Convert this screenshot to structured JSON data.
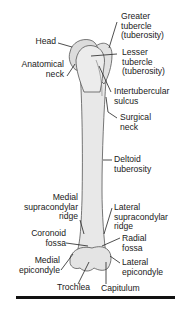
{
  "figure": {
    "bone_color": "#e6e6e6",
    "outline_color": "#555555",
    "leader_color": "#222222",
    "labels": {
      "greater_tubercle": [
        "Greater",
        "tubercle",
        "(tuberosity)"
      ],
      "head": [
        "Head"
      ],
      "lesser_tubercle": [
        "Lesser",
        "tubercle",
        "(tuberosity)"
      ],
      "anatomical_neck": [
        "Anatomical",
        "neck"
      ],
      "intertubercular_sulcus": [
        "Intertubercular",
        "sulcus"
      ],
      "surgical_neck": [
        "Surgical",
        "neck"
      ],
      "deltoid_tuberosity": [
        "Deltoid",
        "tuberosity"
      ],
      "medial_supracondylar_ridge": [
        "Medial",
        "supracondylar",
        "ridge"
      ],
      "lateral_supracondylar_ridge": [
        "Lateral",
        "supracondylar",
        "ridge"
      ],
      "coronoid_fossa": [
        "Coronoid",
        "fossa"
      ],
      "radial_fossa": [
        "Radial",
        "fossa"
      ],
      "medial_epicondyle": [
        "Medial",
        "epicondyle"
      ],
      "lateral_epicondyle": [
        "Lateral",
        "epicondyle"
      ],
      "trochlea": [
        "Trochlea"
      ],
      "capitulum": [
        "Capitulum"
      ]
    }
  }
}
